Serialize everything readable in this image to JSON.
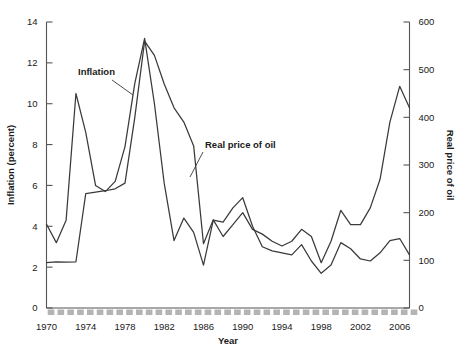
{
  "chart_data": {
    "type": "line",
    "title": "",
    "xlabel": "Year",
    "ylabel": "Inflation (percent)",
    "y2label": "Real price of oil",
    "grid": false,
    "legend_position": "inline-annotations",
    "xlim": [
      1970,
      2007
    ],
    "ylim": [
      0,
      14
    ],
    "y2lim": [
      0,
      600
    ],
    "xticks": [
      1970,
      1974,
      1978,
      1982,
      1986,
      1990,
      1994,
      1998,
      2002,
      2006
    ],
    "xtick_labels": [
      "1970",
      "1974",
      "1978",
      "1982",
      "1986",
      "1990",
      "1994",
      "1998",
      "2002",
      "2006"
    ],
    "yticks": [
      0,
      2,
      4,
      6,
      8,
      10,
      12,
      14
    ],
    "ytick_labels": [
      "0",
      "2",
      "4",
      "6",
      "8",
      "10",
      "12",
      "14"
    ],
    "y2ticks": [
      0,
      100,
      200,
      300,
      400,
      500,
      600
    ],
    "y2tick_labels": [
      "0",
      "100",
      "200",
      "300",
      "400",
      "500",
      "600"
    ],
    "x": [
      1970,
      1971,
      1972,
      1973,
      1974,
      1975,
      1976,
      1977,
      1978,
      1979,
      1980,
      1981,
      1982,
      1983,
      1984,
      1985,
      1986,
      1987,
      1988,
      1989,
      1990,
      1991,
      1992,
      1993,
      1994,
      1995,
      1996,
      1997,
      1998,
      1999,
      2000,
      2001,
      2002,
      2003,
      2004,
      2005,
      2006,
      2007
    ],
    "series": [
      {
        "name": "Inflation",
        "axis": "left",
        "units": "percent",
        "annotation": "Inflation",
        "values": [
          4.1,
          3.2,
          4.3,
          10.5,
          8.6,
          6.0,
          5.7,
          6.2,
          7.9,
          11.0,
          13.2,
          10.0,
          6.1,
          3.3,
          4.4,
          3.7,
          2.1,
          4.3,
          4.2,
          4.9,
          5.4,
          4.0,
          3.0,
          2.8,
          2.7,
          2.6,
          3.1,
          2.3,
          1.7,
          2.1,
          3.2,
          2.9,
          2.4,
          2.3,
          2.7,
          3.3,
          3.4,
          2.6
        ]
      },
      {
        "name": "Real price of oil",
        "axis": "right",
        "units": "index",
        "annotation": "Real price of oil",
        "values": [
          95,
          97,
          96,
          97,
          240,
          243,
          246,
          250,
          262,
          400,
          560,
          530,
          470,
          420,
          390,
          340,
          135,
          185,
          150,
          175,
          200,
          165,
          155,
          140,
          130,
          140,
          165,
          150,
          95,
          140,
          205,
          175,
          175,
          210,
          270,
          390,
          465,
          420
        ]
      }
    ]
  },
  "annotations": {
    "inflation": {
      "text": "Inflation",
      "x": 78,
      "y": 75
    },
    "oil": {
      "text": "Real price of oil",
      "x": 205,
      "y": 148
    }
  },
  "colors": {
    "line": "#3a3a3a",
    "axis": "#555555",
    "minor_block": "#b4b4b4",
    "background": "#ffffff"
  }
}
